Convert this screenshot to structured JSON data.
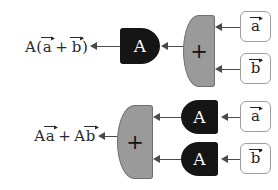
{
  "diagram": {
    "rows": [
      {
        "id": "row-top",
        "result": {
          "prefix": "A(",
          "vec1": "a",
          "operator": "+",
          "vec2": "b",
          "suffix": ")",
          "plain": "A(a + b)"
        },
        "gates": [
          {
            "id": "gate-A-top",
            "glyph": "A",
            "fill": "#151515",
            "text_color": "#ffffff",
            "orientation": "face-right"
          },
          {
            "id": "gate-plus-top",
            "glyph": "+",
            "fill": "#9a9a9a",
            "text_color": "#111111",
            "orientation": "face-left"
          }
        ],
        "terminals": [
          {
            "id": "terminal-a-top",
            "label": "a"
          },
          {
            "id": "terminal-b-top",
            "label": "b"
          }
        ]
      },
      {
        "id": "row-bottom",
        "result": {
          "prefix": "A",
          "vec1": "a",
          "operator": "+",
          "suffix2": "A",
          "vec2": "b",
          "plain": "Aa + Ab"
        },
        "gates": [
          {
            "id": "gate-plus-bottom",
            "glyph": "+",
            "fill": "#9a9a9a",
            "text_color": "#111111",
            "orientation": "face-left"
          },
          {
            "id": "gate-A-bottom-1",
            "glyph": "A",
            "fill": "#151515",
            "text_color": "#ffffff",
            "orientation": "face-left"
          },
          {
            "id": "gate-A-bottom-2",
            "glyph": "A",
            "fill": "#151515",
            "text_color": "#ffffff",
            "orientation": "face-left"
          }
        ],
        "terminals": [
          {
            "id": "terminal-a-bottom",
            "label": "a"
          },
          {
            "id": "terminal-b-bottom",
            "label": "b"
          }
        ]
      }
    ],
    "colors": {
      "gate_dark": "#151515",
      "gate_light": "#9a9a9a",
      "wire": "#4a4a4a",
      "terminal_border": "#9d9d9d",
      "background": "#ffffff",
      "text": "#2b2b2b"
    }
  }
}
